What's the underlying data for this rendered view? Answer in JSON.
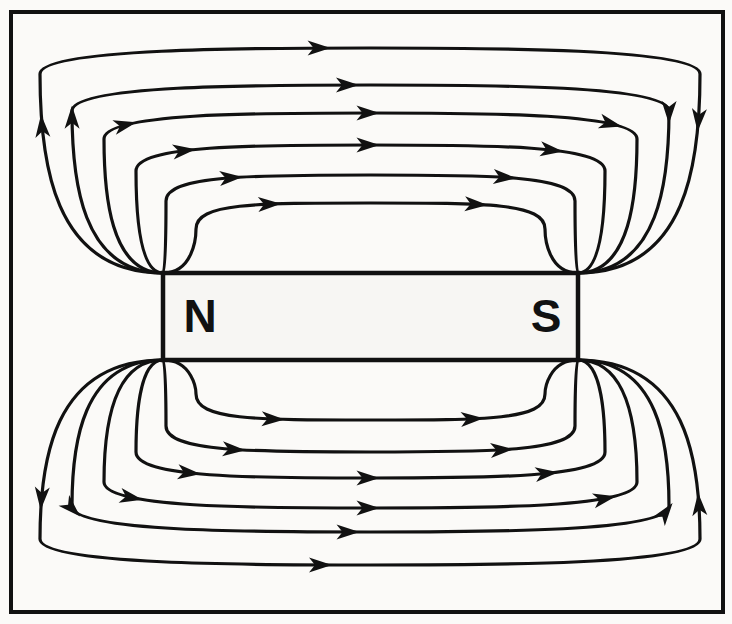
{
  "figure": {
    "name": "bar-magnet-magnetic-field-diagram",
    "width": 732,
    "height": 624,
    "background_color": "#fbfaf8",
    "ink_color": "#111111",
    "stroke_width": 3.2
  },
  "border": {
    "name": "diagram-frame",
    "x": 11,
    "y": 12,
    "width": 712,
    "height": 600,
    "stroke_width": 4,
    "color": "#111111",
    "fill": "none"
  },
  "magnet": {
    "name": "bar-magnet",
    "x": 163,
    "y": 273,
    "width": 415,
    "height": 87,
    "fill": "#f7f6f3",
    "stroke": "#111111",
    "stroke_width": 4.5,
    "north_label": "N",
    "south_label": "S",
    "north_label_x": 200,
    "south_label_x": 546,
    "label_y": 332,
    "label_font_size": 46
  },
  "field": {
    "direction_note": "out of N, around, into S",
    "arrow_color": "#111111",
    "line_color": "#111111",
    "top_loop_count": 6,
    "bottom_loop_count": 6,
    "top_line_y_at_center": [
      48,
      85,
      113,
      145,
      175,
      203
    ],
    "bottom_line_y_at_center": [
      420,
      452,
      478,
      508,
      532,
      565
    ],
    "loops_top": [
      {
        "id": "top-1",
        "exit_x": 163,
        "entry_x": 578,
        "apex_y": 203,
        "side_x_left": 196,
        "side_x_right": 545,
        "arrow_t": [
          0.3,
          0.72
        ]
      },
      {
        "id": "top-2",
        "exit_x": 163,
        "entry_x": 578,
        "apex_y": 175,
        "side_x_left": 166,
        "side_x_right": 575,
        "arrow_t": [
          0.26,
          0.74
        ]
      },
      {
        "id": "top-3",
        "exit_x": 163,
        "entry_x": 578,
        "apex_y": 145,
        "side_x_left": 136,
        "side_x_right": 605,
        "arrow_t": [
          0.24,
          0.5,
          0.76
        ]
      },
      {
        "id": "top-4",
        "exit_x": 163,
        "entry_x": 578,
        "apex_y": 113,
        "side_x_left": 104,
        "side_x_right": 637,
        "arrow_t": [
          0.22,
          0.5,
          0.78
        ]
      },
      {
        "id": "top-5",
        "exit_x": 163,
        "entry_x": 578,
        "apex_y": 85,
        "side_x_left": 72,
        "side_x_right": 669,
        "arrow_t": [
          0.2,
          0.48,
          0.8
        ]
      },
      {
        "id": "top-6",
        "exit_x": 163,
        "entry_x": 578,
        "apex_y": 48,
        "side_x_left": 40,
        "side_x_right": 700,
        "arrow_t": [
          0.18,
          0.46,
          0.82
        ]
      }
    ],
    "loops_bottom": [
      {
        "id": "bottom-1",
        "exit_x": 163,
        "entry_x": 578,
        "apex_y": 420,
        "side_x_left": 196,
        "side_x_right": 545,
        "arrow_t": [
          0.3,
          0.72
        ]
      },
      {
        "id": "bottom-2",
        "exit_x": 163,
        "entry_x": 578,
        "apex_y": 452,
        "side_x_left": 166,
        "side_x_right": 575,
        "arrow_t": [
          0.26,
          0.74
        ]
      },
      {
        "id": "bottom-3",
        "exit_x": 163,
        "entry_x": 578,
        "apex_y": 478,
        "side_x_left": 136,
        "side_x_right": 605,
        "arrow_t": [
          0.24,
          0.5,
          0.76
        ]
      },
      {
        "id": "bottom-4",
        "exit_x": 163,
        "entry_x": 578,
        "apex_y": 508,
        "side_x_left": 104,
        "side_x_right": 637,
        "arrow_t": [
          0.22,
          0.5,
          0.78
        ]
      },
      {
        "id": "bottom-5",
        "exit_x": 163,
        "entry_x": 578,
        "apex_y": 532,
        "side_x_left": 72,
        "side_x_right": 669,
        "arrow_t": [
          0.2,
          0.48,
          0.8
        ]
      },
      {
        "id": "bottom-6",
        "exit_x": 163,
        "entry_x": 578,
        "apex_y": 565,
        "side_x_left": 40,
        "side_x_right": 700,
        "arrow_t": [
          0.18,
          0.46,
          0.82
        ]
      }
    ]
  }
}
